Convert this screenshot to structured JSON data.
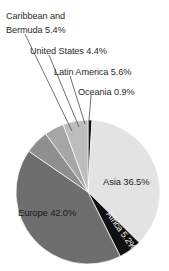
{
  "chart_data": {
    "type": "pie",
    "title": "",
    "subtitle": "",
    "xlabel": "",
    "ylabel": "",
    "legend_position": "none",
    "grid": false,
    "units": "percent",
    "categories": [
      "Oceania",
      "Asia",
      "Africa",
      "Europe",
      "Caribbean and Bermuda",
      "United States",
      "Latin America"
    ],
    "values": [
      0.9,
      36.5,
      5.2,
      42.0,
      5.4,
      4.4,
      5.6
    ],
    "slices": [
      {
        "name": "Oceania",
        "value": 0.9,
        "label": "Oceania  0.9%",
        "label_placement": "outside",
        "color": "#151515",
        "start_angle_deg": 0.0,
        "end_angle_deg": 3.24
      },
      {
        "name": "Asia",
        "value": 36.5,
        "label": "Asia  36.5%",
        "label_placement": "inside",
        "color": "#e3e3e3",
        "start_angle_deg": 3.24,
        "end_angle_deg": 134.64
      },
      {
        "name": "Africa",
        "value": 5.2,
        "label": "Africa  5.2%",
        "label_placement": "inside-rotated",
        "color": "#101010",
        "start_angle_deg": 134.64,
        "end_angle_deg": 153.36
      },
      {
        "name": "Europe",
        "value": 42.0,
        "label": "Europe  42.0%",
        "label_placement": "inside",
        "color": "#6e6e6e",
        "start_angle_deg": 153.36,
        "end_angle_deg": 304.56
      },
      {
        "name": "Caribbean and Bermuda",
        "value": 5.4,
        "label_line1": "Caribbean and",
        "label_line2": "Bermuda  5.4%",
        "label_placement": "outside",
        "color": "#8f8f8f",
        "start_angle_deg": 304.56,
        "end_angle_deg": 324.0
      },
      {
        "name": "United States",
        "value": 4.4,
        "label": "United States  4.4%",
        "label_placement": "outside",
        "color": "#a6a6a6",
        "start_angle_deg": 324.0,
        "end_angle_deg": 339.84
      },
      {
        "name": "Latin America",
        "value": 5.6,
        "label": "Latin America  5.6%",
        "label_placement": "outside",
        "color": "#bdbdbd",
        "start_angle_deg": 339.84,
        "end_angle_deg": 360.0
      }
    ]
  },
  "labels": {
    "caribbean_line1": "Caribbean and",
    "caribbean_line2": "Bermuda  5.4%",
    "united_states": "United States  4.4%",
    "latin_america": "Latin America  5.6%",
    "oceania": "Oceania  0.9%",
    "asia": "Asia  36.5%",
    "europe": "Europe  42.0%",
    "africa": "Africa  5.2%"
  },
  "colors": {
    "background": "#ffffff",
    "text": "#2b2b2b",
    "text_on_dark": "#f2f2f2",
    "leader_line": "#4a4a4a",
    "slice_oceania": "#151515",
    "slice_asia": "#e3e3e3",
    "slice_africa": "#101010",
    "slice_europe": "#6e6e6e",
    "slice_caribbean": "#8f8f8f",
    "slice_united_states": "#a6a6a6",
    "slice_latin_america": "#bdbdbd"
  }
}
